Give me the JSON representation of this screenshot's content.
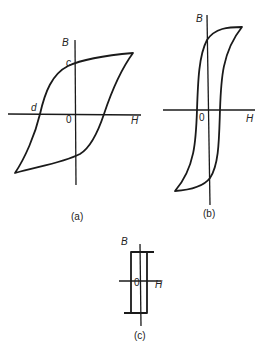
{
  "figure": {
    "panels": [
      {
        "id": "a",
        "caption": "(a)",
        "axis_labels": {
          "vertical": "B",
          "horizontal": "H",
          "origin": "0"
        },
        "point_labels": {
          "remanence": "c",
          "coercivity": "d"
        },
        "shape": "wide hysteresis loop"
      },
      {
        "id": "b",
        "caption": "(b)",
        "axis_labels": {
          "vertical": "B",
          "horizontal": "H",
          "origin": "0"
        },
        "shape": "narrow tall hysteresis loop"
      },
      {
        "id": "c",
        "caption": "(c)",
        "axis_labels": {
          "vertical": "B",
          "horizontal": "H",
          "origin": "0"
        },
        "shape": "rectangular hysteresis loop"
      }
    ],
    "colors": {
      "line": "#1a1a1a",
      "text": "#222222",
      "background": "#ffffff"
    }
  }
}
